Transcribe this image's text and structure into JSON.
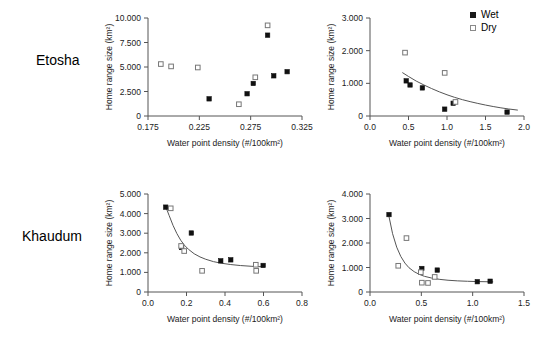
{
  "figure": {
    "row_labels": [
      {
        "id": "etosha",
        "text": "Etosha"
      },
      {
        "id": "khaudum",
        "text": "Khaudum"
      }
    ],
    "legend": {
      "position": "top-right",
      "items": [
        {
          "key": "wet",
          "label": "Wet",
          "marker": "filled-square",
          "color": "#111111"
        },
        {
          "key": "dry",
          "label": "Dry",
          "marker": "open-square",
          "color": "#ffffff"
        }
      ]
    },
    "common": {
      "xlabel": "Water point density (#/100km²)",
      "ylabel": "Home range size (km²)"
    }
  },
  "chart_data": [
    {
      "id": "etosha-left",
      "type": "scatter",
      "title": "",
      "region": "Etosha",
      "xlabel": "Water point density (#/100km²)",
      "ylabel": "Home range size (km²)",
      "xlim": [
        0.175,
        0.325
      ],
      "ylim": [
        0,
        10000
      ],
      "xticks": [
        0.175,
        0.225,
        0.275,
        0.325
      ],
      "xticklabels": [
        "0.175",
        "0.225",
        "0.275",
        "0.325"
      ],
      "yticks": [
        0,
        2500,
        5000,
        7500,
        10000
      ],
      "yticklabels": [
        "0",
        "2.500",
        "5.000",
        "7.500",
        "10.000"
      ],
      "grid": false,
      "trendline": null,
      "series": [
        {
          "name": "Wet",
          "marker": "filled-square",
          "points": [
            [
              0.2345,
              1750
            ],
            [
              0.2715,
              2270
            ],
            [
              0.2775,
              3320
            ],
            [
              0.2915,
              8250
            ],
            [
              0.2975,
              4100
            ],
            [
              0.3105,
              4520
            ]
          ]
        },
        {
          "name": "Dry",
          "marker": "open-square",
          "points": [
            [
              0.1875,
              5300
            ],
            [
              0.1975,
              5060
            ],
            [
              0.2235,
              4950
            ],
            [
              0.2635,
              1200
            ],
            [
              0.2795,
              3950
            ],
            [
              0.2915,
              9250
            ]
          ]
        }
      ]
    },
    {
      "id": "etosha-right",
      "type": "scatter",
      "title": "",
      "region": "Etosha",
      "xlabel": "Water point density (#/100km²)",
      "ylabel": "Home range size (km²)",
      "xlim": [
        0.0,
        2.0
      ],
      "ylim": [
        0,
        3000
      ],
      "xticks": [
        0.0,
        0.5,
        1.0,
        1.5,
        2.0
      ],
      "xticklabels": [
        "0.0",
        "0.5",
        "1.0",
        "1.5",
        "2.0"
      ],
      "yticks": [
        0,
        1000,
        2000,
        3000
      ],
      "yticklabels": [
        "0",
        "1.000",
        "2.000",
        "3.000"
      ],
      "grid": false,
      "trendline": {
        "type": "power-decay",
        "x_start": 0.42,
        "x_end": 1.92,
        "points": [
          [
            0.42,
            1330
          ],
          [
            0.5,
            1210
          ],
          [
            0.6,
            1070
          ],
          [
            0.7,
            950
          ],
          [
            0.8,
            840
          ],
          [
            0.9,
            740
          ],
          [
            1.0,
            650
          ],
          [
            1.1,
            570
          ],
          [
            1.2,
            500
          ],
          [
            1.3,
            440
          ],
          [
            1.4,
            385
          ],
          [
            1.5,
            335
          ],
          [
            1.6,
            290
          ],
          [
            1.7,
            250
          ],
          [
            1.8,
            215
          ],
          [
            1.92,
            180
          ]
        ]
      },
      "series": [
        {
          "name": "Wet",
          "marker": "filled-square",
          "points": [
            [
              0.47,
              1075
            ],
            [
              0.52,
              950
            ],
            [
              0.68,
              860
            ],
            [
              0.97,
              210
            ],
            [
              1.08,
              390
            ],
            [
              1.78,
              120
            ]
          ]
        },
        {
          "name": "Dry",
          "marker": "open-square",
          "points": [
            [
              0.455,
              1940
            ],
            [
              0.97,
              1320
            ],
            [
              1.11,
              430
            ]
          ]
        }
      ]
    },
    {
      "id": "khaudum-left",
      "type": "scatter",
      "title": "",
      "region": "Khaudum",
      "xlabel": "Water point density (#/100km²)",
      "ylabel": "Home range size (km²)",
      "xlim": [
        0.0,
        0.8
      ],
      "ylim": [
        0,
        5000
      ],
      "xticks": [
        0.0,
        0.2,
        0.4,
        0.6,
        0.8
      ],
      "xticklabels": [
        "0.0",
        "0.2",
        "0.4",
        "0.6",
        "0.8"
      ],
      "yticks": [
        0,
        1000,
        2000,
        3000,
        4000,
        5000
      ],
      "yticklabels": [
        "0",
        "1.000",
        "2.000",
        "3.000",
        "4.000",
        "5.000"
      ],
      "grid": false,
      "trendline": {
        "type": "power-decay",
        "x_start": 0.09,
        "x_end": 0.6,
        "points": [
          [
            0.09,
            4400
          ],
          [
            0.11,
            3900
          ],
          [
            0.13,
            3400
          ],
          [
            0.15,
            2980
          ],
          [
            0.17,
            2640
          ],
          [
            0.19,
            2380
          ],
          [
            0.21,
            2180
          ],
          [
            0.24,
            1950
          ],
          [
            0.27,
            1790
          ],
          [
            0.3,
            1670
          ],
          [
            0.34,
            1550
          ],
          [
            0.38,
            1470
          ],
          [
            0.43,
            1400
          ],
          [
            0.48,
            1350
          ],
          [
            0.54,
            1310
          ],
          [
            0.6,
            1285
          ]
        ]
      },
      "series": [
        {
          "name": "Wet",
          "marker": "filled-square",
          "points": [
            [
              0.092,
              4330
            ],
            [
              0.175,
              2270
            ],
            [
              0.225,
              3010
            ],
            [
              0.378,
              1590
            ],
            [
              0.43,
              1640
            ],
            [
              0.598,
              1355
            ]
          ]
        },
        {
          "name": "Dry",
          "marker": "open-square",
          "points": [
            [
              0.118,
              4270
            ],
            [
              0.172,
              2350
            ],
            [
              0.188,
              2090
            ],
            [
              0.281,
              1080
            ],
            [
              0.56,
              1390
            ],
            [
              0.562,
              1080
            ]
          ]
        }
      ]
    },
    {
      "id": "khaudum-right",
      "type": "scatter",
      "title": "",
      "region": "Khaudum",
      "xlabel": "Water point density (#/100km²)",
      "ylabel": "Home range size (km²)",
      "xlim": [
        0.0,
        1.5
      ],
      "ylim": [
        0,
        4000
      ],
      "xticks": [
        0.0,
        0.5,
        1.0,
        1.5
      ],
      "xticklabels": [
        "0.0",
        "0.5",
        "1.0",
        "1.5"
      ],
      "yticks": [
        0,
        1000,
        2000,
        3000,
        4000
      ],
      "yticklabels": [
        "0",
        "1.000",
        "2.000",
        "3.000",
        "4.000"
      ],
      "grid": false,
      "trendline": {
        "type": "power-decay",
        "x_start": 0.185,
        "x_end": 1.2,
        "points": [
          [
            0.185,
            3080
          ],
          [
            0.22,
            2380
          ],
          [
            0.26,
            1830
          ],
          [
            0.3,
            1450
          ],
          [
            0.34,
            1180
          ],
          [
            0.38,
            990
          ],
          [
            0.43,
            830
          ],
          [
            0.48,
            720
          ],
          [
            0.53,
            640
          ],
          [
            0.6,
            570
          ],
          [
            0.68,
            515
          ],
          [
            0.76,
            480
          ],
          [
            0.85,
            455
          ],
          [
            0.95,
            438
          ],
          [
            1.05,
            425
          ],
          [
            1.2,
            415
          ]
        ]
      },
      "series": [
        {
          "name": "Wet",
          "marker": "filled-square",
          "points": [
            [
              0.185,
              3160
            ],
            [
              0.505,
              960
            ],
            [
              0.655,
              895
            ],
            [
              1.045,
              420
            ],
            [
              1.17,
              440
            ]
          ]
        },
        {
          "name": "Dry",
          "marker": "open-square",
          "points": [
            [
              0.275,
              1070
            ],
            [
              0.355,
              2200
            ],
            [
              0.495,
              810
            ],
            [
              0.505,
              380
            ],
            [
              0.565,
              370
            ],
            [
              0.63,
              615
            ]
          ]
        }
      ]
    }
  ]
}
